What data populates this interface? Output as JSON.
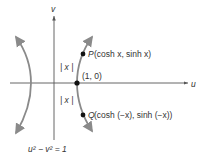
{
  "diagram": {
    "axes": {
      "horizontal_label": "u",
      "vertical_label": "v"
    },
    "curve_label": "u² − v² = 1",
    "points": {
      "vertex": {
        "label": "(1, 0)"
      },
      "P": {
        "name": "P",
        "label": "(cosh x, sinh x)"
      },
      "Q": {
        "name": "Q",
        "label": "(cosh (−x), sinh (−x))"
      }
    },
    "distance_labels": {
      "upper": "| x |",
      "lower": "| x |"
    },
    "colors": {
      "axis": "#555555",
      "curve": "#8a8a8a",
      "point": "#111111",
      "text": "#333333"
    }
  }
}
